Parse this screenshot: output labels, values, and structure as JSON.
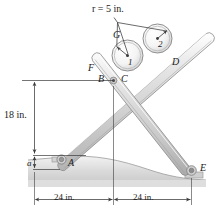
{
  "figure": {
    "type": "engineering-mechanics-diagram",
    "colors": {
      "bar_fill": "#d8d8d8",
      "bar_stroke": "#8a8a8a",
      "ground_fill": "#e2e2e2",
      "ground_stroke": "#9a9a9a",
      "line": "#3a3a3a",
      "text": "#1a1a1a",
      "roller_stroke": "#8e8e8e"
    }
  },
  "labels": {
    "radius_note": "r = 5 in.",
    "point_G": "G",
    "roller_1": "1",
    "roller_2": "2",
    "point_F": "F",
    "point_B": "B",
    "point_C": "C",
    "point_D": "D",
    "point_A": "A",
    "point_E": "E",
    "dim_a": "a",
    "dim_vertical": "18 in.",
    "dim_left": "24 in.",
    "dim_right": "24 in."
  },
  "dimensions": {
    "radius_value": 5,
    "radius_unit": "in.",
    "height_value": 18,
    "height_unit": "in.",
    "span_left_value": 24,
    "span_right_value": 24,
    "span_unit": "in."
  }
}
